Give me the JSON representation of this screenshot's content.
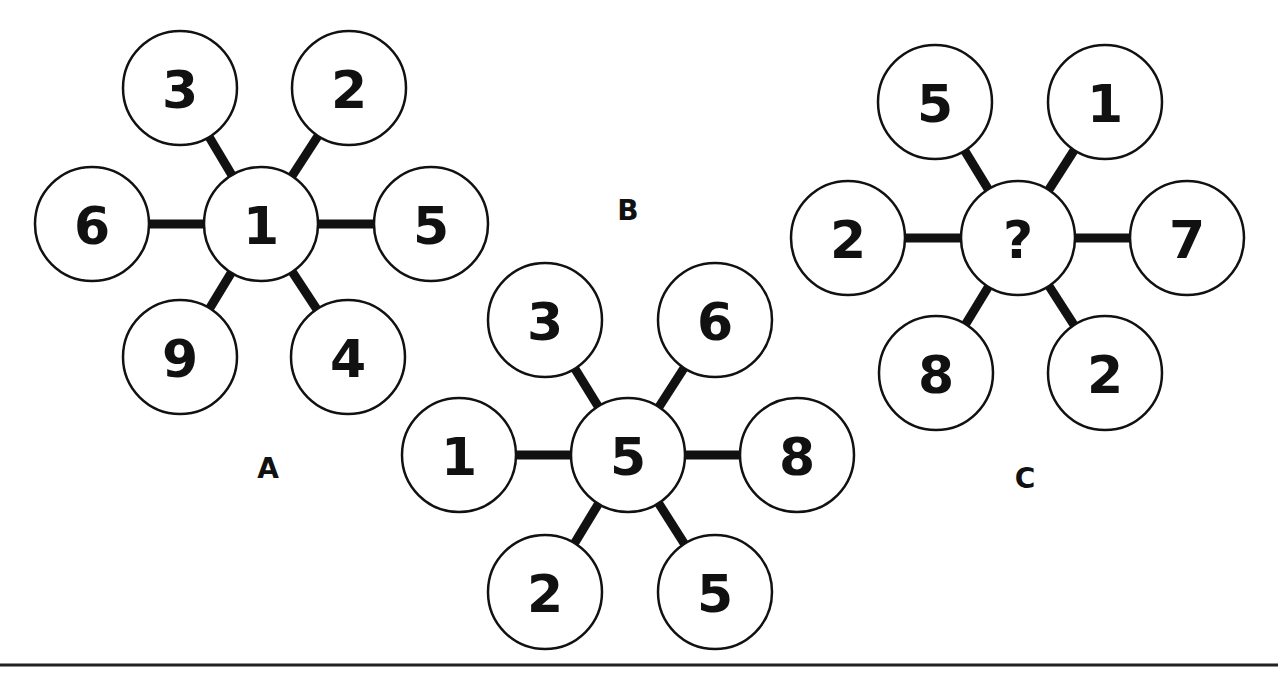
{
  "puzzle": {
    "node_radius": 57,
    "colors": {
      "ink": "#111111",
      "background": "#ffffff"
    },
    "diagrams": [
      {
        "id": "A",
        "label": "A",
        "label_pos": [
          268,
          468
        ],
        "center": {
          "x": 261,
          "y": 224,
          "value": "1"
        },
        "spokes": [
          {
            "x": 180,
            "y": 88,
            "value": "3"
          },
          {
            "x": 349,
            "y": 88,
            "value": "2"
          },
          {
            "x": 92,
            "y": 224,
            "value": "6"
          },
          {
            "x": 431,
            "y": 224,
            "value": "5"
          },
          {
            "x": 180,
            "y": 357,
            "value": "9"
          },
          {
            "x": 348,
            "y": 357,
            "value": "4"
          }
        ]
      },
      {
        "id": "B",
        "label": "B",
        "label_pos": [
          628,
          210
        ],
        "center": {
          "x": 628,
          "y": 455,
          "value": "5"
        },
        "spokes": [
          {
            "x": 545,
            "y": 320,
            "value": "3"
          },
          {
            "x": 715,
            "y": 320,
            "value": "6"
          },
          {
            "x": 459,
            "y": 455,
            "value": "1"
          },
          {
            "x": 797,
            "y": 455,
            "value": "8"
          },
          {
            "x": 545,
            "y": 592,
            "value": "2"
          },
          {
            "x": 715,
            "y": 592,
            "value": "5"
          }
        ]
      },
      {
        "id": "C",
        "label": "C",
        "label_pos": [
          1025,
          478
        ],
        "center": {
          "x": 1018,
          "y": 238,
          "value": "?"
        },
        "spokes": [
          {
            "x": 935,
            "y": 102,
            "value": "5"
          },
          {
            "x": 1105,
            "y": 102,
            "value": "1"
          },
          {
            "x": 848,
            "y": 238,
            "value": "2"
          },
          {
            "x": 1187,
            "y": 238,
            "value": "7"
          },
          {
            "x": 936,
            "y": 373,
            "value": "8"
          },
          {
            "x": 1105,
            "y": 373,
            "value": "2"
          }
        ]
      }
    ],
    "bottom_rule_y": 665
  }
}
